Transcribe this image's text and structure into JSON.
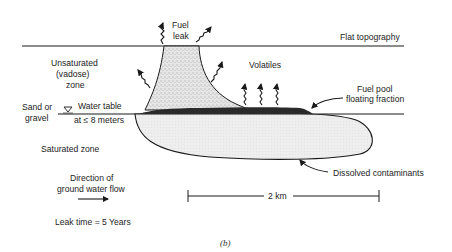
{
  "figure": {
    "caption": "(b)",
    "labels": {
      "fuel_leak_line1": "Fuel",
      "fuel_leak_line2": "leak",
      "flat_topography": "Flat topography",
      "unsaturated_line1": "Unsaturated",
      "unsaturated_line2": "(vadose)",
      "unsaturated_line3": "zone",
      "volatiles": "Volatiles",
      "fuel_pool_line1": "Fuel pool",
      "fuel_pool_line2": "floating fraction",
      "sand_line1": "Sand or",
      "sand_line2": "gravel",
      "water_table": "Water table",
      "water_depth": "at ≤ 8 meters",
      "saturated_zone": "Saturated zone",
      "flow_line1": "Direction of",
      "flow_line2": "ground water flow",
      "dissolved": "Dissolved contaminants",
      "scale": "2 km",
      "leak_time": "Leak time = 5 Years"
    },
    "colors": {
      "ink": "#1a1a1a",
      "plume_fill": "#d8d8d8",
      "fuel_pool": "#2a2a2a",
      "dissolved_fill": "#ececec",
      "background": "#ffffff"
    }
  }
}
